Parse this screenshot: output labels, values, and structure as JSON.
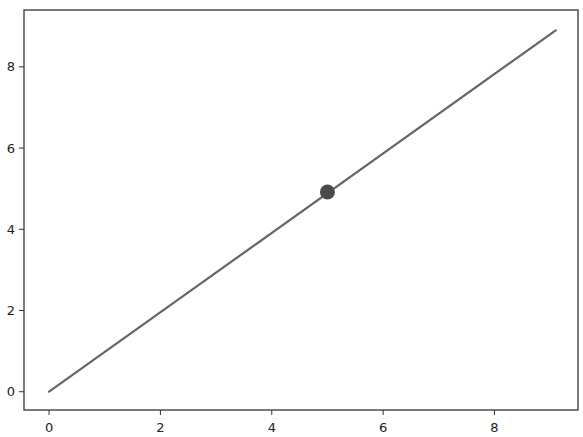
{
  "chart_data": {
    "type": "line",
    "title": "",
    "xlabel": "",
    "ylabel": "",
    "xlim": [
      -0.45,
      9.5
    ],
    "ylim": [
      -0.45,
      9.4
    ],
    "grid": false,
    "legend": null,
    "xticks": [
      0,
      2,
      4,
      6,
      8
    ],
    "yticks": [
      0,
      2,
      4,
      6,
      8
    ],
    "xtick_labels": [
      "0",
      "2",
      "4",
      "6",
      "8"
    ],
    "ytick_labels": [
      "0",
      "2",
      "4",
      "6",
      "8"
    ],
    "series": [
      {
        "name": "line",
        "type": "line",
        "color": "#666666",
        "x": [
          0,
          9.1
        ],
        "y": [
          0,
          8.9
        ]
      },
      {
        "name": "marker",
        "type": "scatter",
        "color": "#4a4a4a",
        "x": [
          5.0
        ],
        "y": [
          4.92
        ]
      }
    ]
  }
}
